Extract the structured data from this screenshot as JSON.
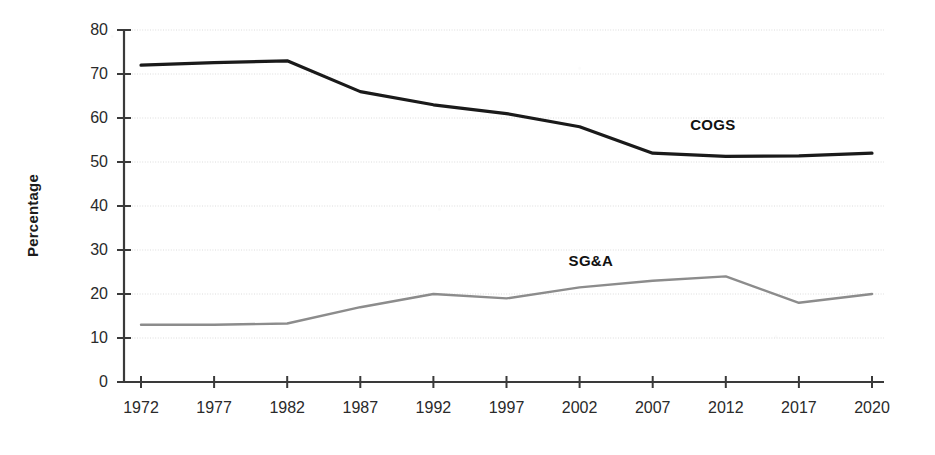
{
  "chart_data": {
    "type": "line",
    "title": "",
    "xlabel": "",
    "ylabel": "Percentage",
    "categories": [
      "1972",
      "1977",
      "1982",
      "1987",
      "1992",
      "1997",
      "2002",
      "2007",
      "2012",
      "2017",
      "2020"
    ],
    "ylim": [
      0,
      80
    ],
    "ytick_values": [
      0,
      10,
      20,
      30,
      40,
      50,
      60,
      70,
      80
    ],
    "grid": true,
    "legend_position": "inline-annotation",
    "series": [
      {
        "name": "COGS",
        "color": "#1a1a1a",
        "values": [
          72,
          72.6,
          73,
          66,
          63,
          61,
          58,
          52,
          51.3,
          51.4,
          52
        ]
      },
      {
        "name": "SG&A",
        "color": "#8c8c8c",
        "values": [
          13,
          13,
          13.3,
          17,
          20,
          19,
          21.5,
          23,
          24,
          18,
          20
        ]
      }
    ],
    "annotations": [
      {
        "text": "COGS",
        "x_frac": 0.745,
        "y_value": 58.5
      },
      {
        "text": "SG&A",
        "x_frac": 0.585,
        "y_value": 27.5
      }
    ]
  },
  "axis": {
    "y_ticks": [
      {
        "label": "80",
        "value": 80
      },
      {
        "label": "70",
        "value": 70
      },
      {
        "label": "60",
        "value": 60
      },
      {
        "label": "50",
        "value": 50
      },
      {
        "label": "40",
        "value": 40
      },
      {
        "label": "30",
        "value": 30
      },
      {
        "label": "20",
        "value": 20
      },
      {
        "label": "10",
        "value": 10
      },
      {
        "label": "0",
        "value": 0
      }
    ],
    "x_ticks": [
      {
        "label": "1972"
      },
      {
        "label": "1977"
      },
      {
        "label": "1982"
      },
      {
        "label": "1987"
      },
      {
        "label": "1992"
      },
      {
        "label": "1997"
      },
      {
        "label": "2002"
      },
      {
        "label": "2007"
      },
      {
        "label": "2012"
      },
      {
        "label": "2017"
      },
      {
        "label": "2020"
      }
    ]
  },
  "colors": {
    "cogs_line": "#1a1a1a",
    "sga_line": "#8c8c8c",
    "axis": "#3a3a3a",
    "grid": "#dcdcdc",
    "background": "#ffffff"
  }
}
